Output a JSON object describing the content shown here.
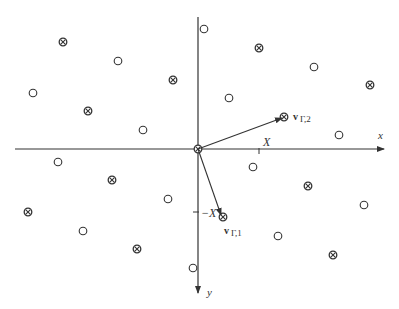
{
  "diagram": {
    "type": "lattice-diagram",
    "origin": [
      198,
      149
    ],
    "axes": {
      "x": {
        "label": "x",
        "from": [
          15,
          149
        ],
        "to": [
          384,
          149
        ],
        "label_pos": [
          378,
          139
        ]
      },
      "y": {
        "label": "y",
        "from": [
          198,
          17
        ],
        "to": [
          198,
          293
        ],
        "label_pos": [
          207,
          296
        ]
      }
    },
    "ticks": {
      "x_tick": {
        "label": "X",
        "pos": [
          259,
          149
        ],
        "label_pos": [
          263,
          146
        ]
      },
      "y_tick": {
        "label": "−X",
        "pos": [
          198,
          212
        ],
        "label_pos": [
          201,
          217
        ]
      }
    },
    "vectors": [
      {
        "name": "v_gamma_2",
        "label_main": "v",
        "label_sub": "Γ,2",
        "from": [
          198,
          149
        ],
        "to": [
          282,
          118
        ],
        "label_pos": [
          293,
          120
        ]
      },
      {
        "name": "v_gamma_1",
        "label_main": "v",
        "label_sub": "Γ,1",
        "from": [
          198,
          149
        ],
        "to": [
          221,
          215
        ],
        "label_pos": [
          224,
          234
        ]
      }
    ],
    "legend_symbols": {
      "open_circle": "○",
      "crossed_circle": "⊗"
    },
    "points_open": [
      [
        118,
        61
      ],
      [
        33,
        93
      ],
      [
        143,
        130
      ],
      [
        204,
        29
      ],
      [
        314,
        67
      ],
      [
        229,
        98
      ],
      [
        339,
        135
      ],
      [
        58,
        162
      ],
      [
        168,
        199
      ],
      [
        83,
        231
      ],
      [
        193,
        268
      ],
      [
        253,
        167
      ],
      [
        364,
        205
      ],
      [
        278,
        236
      ]
    ],
    "points_crossed": [
      [
        63,
        42
      ],
      [
        173,
        80
      ],
      [
        88,
        111
      ],
      [
        259,
        48
      ],
      [
        370,
        85
      ],
      [
        284,
        117
      ],
      [
        112,
        180
      ],
      [
        28,
        212
      ],
      [
        137,
        249
      ],
      [
        308,
        186
      ],
      [
        223,
        217
      ],
      [
        333,
        255
      ],
      [
        198,
        149
      ]
    ],
    "colors": {
      "stroke": "#333333",
      "background": "#ffffff"
    }
  }
}
